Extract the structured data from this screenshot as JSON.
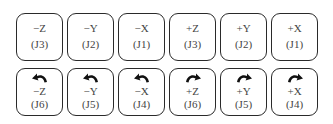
{
  "translation_row": {
    "buttons": [
      {
        "axis": "−Z",
        "joint": "(J3)"
      },
      {
        "axis": "−Y",
        "joint": "(J2)"
      },
      {
        "axis": "−X",
        "joint": "(J1)"
      },
      {
        "axis": "+Z",
        "joint": "(J3)"
      },
      {
        "axis": "+Y",
        "joint": "(J2)"
      },
      {
        "axis": "+X",
        "joint": "(J1)"
      }
    ]
  },
  "rotation_row": {
    "buttons": [
      {
        "axis": "−Z",
        "joint": "(J6)",
        "icon": "rotate-ccw-icon"
      },
      {
        "axis": "−Y",
        "joint": "(J5)",
        "icon": "rotate-ccw-icon"
      },
      {
        "axis": "−X",
        "joint": "(J4)",
        "icon": "rotate-ccw-icon"
      },
      {
        "axis": "+Z",
        "joint": "(J6)",
        "icon": "rotate-cw-icon"
      },
      {
        "axis": "+Y",
        "joint": "(J5)",
        "icon": "rotate-cw-icon"
      },
      {
        "axis": "+X",
        "joint": "(J4)",
        "icon": "rotate-cw-icon"
      }
    ]
  },
  "colors": {
    "border": "#2a2a2a",
    "text": "#444444",
    "icon": "#111111",
    "background": "#ffffff"
  }
}
